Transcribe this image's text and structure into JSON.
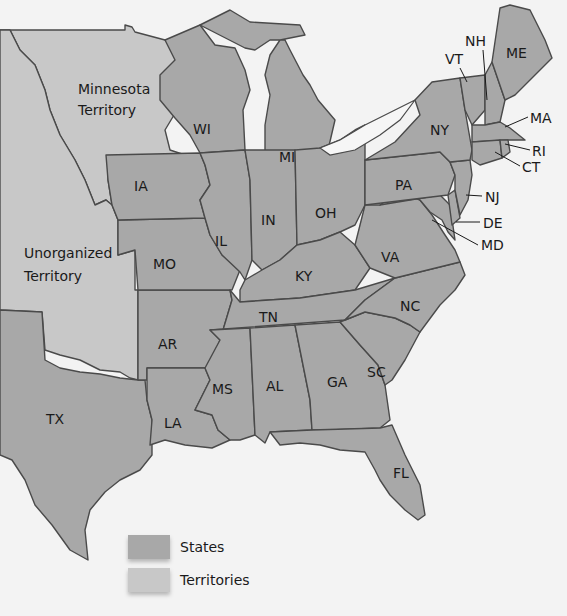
{
  "map": {
    "colors": {
      "states": "#a8a8a8",
      "territories": "#c8c8c8",
      "background": "#f3f3f3",
      "border": "#4a4a4a"
    },
    "territories": [
      {
        "name": "Minnesota Territory",
        "line1": "Minnesota",
        "line2": "Territory"
      },
      {
        "name": "Unorganized Territory",
        "line1": "Unorganized",
        "line2": "Territory"
      }
    ],
    "states": {
      "TX": "TX",
      "LA": "LA",
      "AR": "AR",
      "MO": "MO",
      "IA": "IA",
      "WI": "WI",
      "MI": "MI",
      "IL": "IL",
      "IN": "IN",
      "OH": "OH",
      "KY": "KY",
      "TN": "TN",
      "MS": "MS",
      "AL": "AL",
      "GA": "GA",
      "FL": "FL",
      "SC": "SC",
      "NC": "NC",
      "VA": "VA",
      "PA": "PA",
      "NY": "NY",
      "VT": "VT",
      "NH": "NH",
      "ME": "ME",
      "MA": "MA",
      "RI": "RI",
      "CT": "CT",
      "NJ": "NJ",
      "DE": "DE",
      "MD": "MD"
    }
  },
  "legend": {
    "items": [
      {
        "label": "States",
        "color": "#a8a8a8"
      },
      {
        "label": "Territories",
        "color": "#c8c8c8"
      }
    ]
  }
}
